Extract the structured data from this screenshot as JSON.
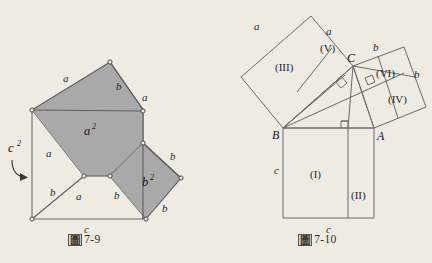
{
  "page": {
    "background_color": "#eeebe3",
    "ink_color": "#3a3a3a",
    "shaded_fill": "#a8a8a8"
  },
  "figure_left": {
    "caption_cjk": "圖",
    "caption_number": "7-9",
    "labels": {
      "c_squared": "c",
      "c_squared_exp": "2",
      "a_squared": "a",
      "a_squared_exp": "2",
      "b_squared": "b",
      "b_squared_exp": "2",
      "edge_a_top": "a",
      "edge_b_topright": "b",
      "edge_a_right": "a",
      "edge_a_left": "a",
      "edge_b_lowerleft": "b",
      "edge_a_lowerleft": "a",
      "edge_b_mid": "b",
      "edge_b_right": "b",
      "edge_b_bottomright": "b",
      "edge_c_bottom": "c"
    }
  },
  "figure_right": {
    "caption_cjk": "圖",
    "caption_number": "7-10",
    "points": {
      "A": "A",
      "B": "B",
      "C": "C"
    },
    "regions": {
      "I": "(I)",
      "II": "(II)",
      "III": "(III)",
      "IV": "(IV)",
      "V": "(V)",
      "VI": "(VI)"
    },
    "edges": {
      "a_upper_left": "a",
      "a_upper_right": "a",
      "b_top": "b",
      "b_right": "b",
      "c_left": "c",
      "c_bottom": "c"
    }
  }
}
